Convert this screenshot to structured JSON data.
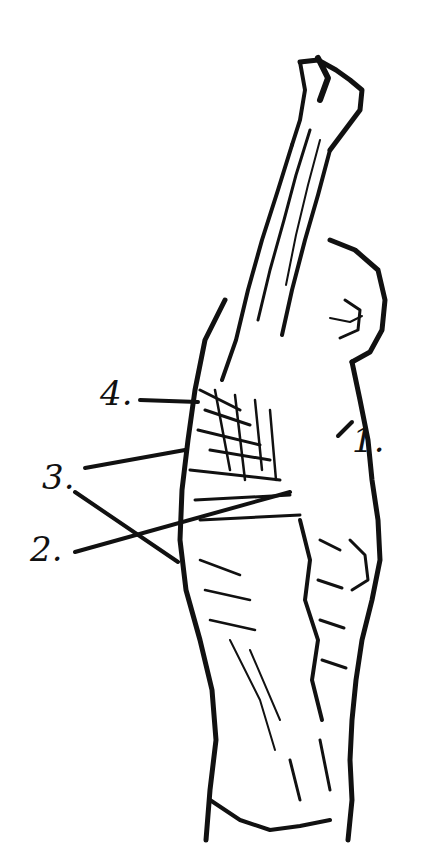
{
  "figure": {
    "ink_color": "#111111",
    "background": "#ffffff"
  },
  "labels": [
    {
      "text": "4.",
      "x": 100,
      "y": 376
    },
    {
      "text": "1.",
      "x": 352,
      "y": 423
    },
    {
      "text": "3.",
      "x": 42,
      "y": 460
    },
    {
      "text": "2.",
      "x": 30,
      "y": 532
    }
  ]
}
